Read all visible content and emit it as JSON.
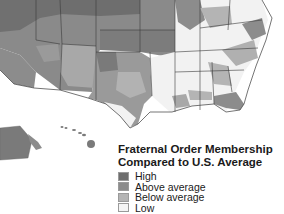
{
  "legend": {
    "title_line1": "Fraternal Order Membership",
    "title_line2": "Compared to U.S. Average",
    "items": [
      {
        "label": "High",
        "color": "#6e6e6e"
      },
      {
        "label": "Above average",
        "color": "#8c8c8c"
      },
      {
        "label": "Below average",
        "color": "#b4b4b4"
      },
      {
        "label": "Low",
        "color": "#f4f4f4"
      }
    ]
  },
  "map": {
    "region": "United States (southern portion, with Alaska and Hawaii insets)",
    "colors": {
      "high": "#6e6e6e",
      "above": "#8c8c8c",
      "below": "#b4b4b4",
      "low": "#f4f4f4",
      "border": "#3a3a3a",
      "ocean": "#ffffff"
    }
  }
}
